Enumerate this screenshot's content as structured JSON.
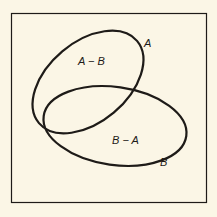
{
  "diagram": {
    "type": "venn",
    "universe_frame": {
      "x": 11,
      "y": 13,
      "width": 196,
      "height": 190
    },
    "sets": [
      {
        "name": "A",
        "label": "A",
        "region_label": "A − B"
      },
      {
        "name": "B",
        "label": "B",
        "region_label": "B − A"
      }
    ],
    "labels": {
      "set_a": "A",
      "set_b": "B",
      "a_minus_b": "A − B",
      "b_minus_a": "B − A"
    },
    "colors": {
      "background": "#fbf6e6",
      "stroke": "#1e1b18"
    }
  }
}
